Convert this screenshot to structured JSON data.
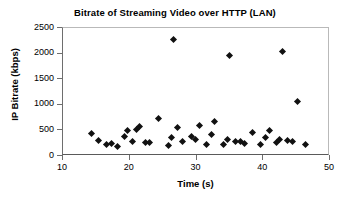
{
  "chart_data": {
    "type": "scatter",
    "title": "Bitrate of Streaming Video over HTTP (LAN)",
    "xlabel": "Time (s)",
    "ylabel": "IP Bitrate (kbps)",
    "xlim": [
      10,
      50
    ],
    "ylim": [
      0,
      2500
    ],
    "xticks": [
      10,
      20,
      30,
      40,
      50
    ],
    "yticks": [
      0,
      500,
      1000,
      1500,
      2000,
      2500
    ],
    "grid": false,
    "legend": false,
    "marker": "diamond",
    "marker_color": "#111111",
    "series": [
      {
        "name": "IP Bitrate",
        "points": [
          [
            14.2,
            440
          ],
          [
            15.3,
            300
          ],
          [
            16.5,
            230
          ],
          [
            17.3,
            250
          ],
          [
            18.1,
            190
          ],
          [
            19.2,
            380
          ],
          [
            19.7,
            505
          ],
          [
            20.4,
            275
          ],
          [
            21.0,
            520
          ],
          [
            21.4,
            580
          ],
          [
            22.3,
            270
          ],
          [
            23.0,
            270
          ],
          [
            24.3,
            740
          ],
          [
            25.8,
            205
          ],
          [
            26.2,
            360
          ],
          [
            26.6,
            2280
          ],
          [
            27.1,
            555
          ],
          [
            27.9,
            290
          ],
          [
            29.2,
            390
          ],
          [
            29.8,
            330
          ],
          [
            30.5,
            600
          ],
          [
            31.5,
            220
          ],
          [
            32.2,
            415
          ],
          [
            32.7,
            675
          ],
          [
            34.0,
            225
          ],
          [
            34.6,
            320
          ],
          [
            35.0,
            1960
          ],
          [
            35.8,
            285
          ],
          [
            36.6,
            290
          ],
          [
            37.2,
            240
          ],
          [
            38.4,
            455
          ],
          [
            39.6,
            230
          ],
          [
            40.3,
            370
          ],
          [
            40.9,
            490
          ],
          [
            42.0,
            265
          ],
          [
            42.5,
            325
          ],
          [
            42.9,
            2045
          ],
          [
            43.6,
            295
          ],
          [
            44.4,
            285
          ],
          [
            45.2,
            1070
          ],
          [
            46.4,
            225
          ]
        ]
      }
    ]
  }
}
